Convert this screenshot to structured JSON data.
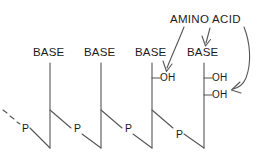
{
  "figure": {
    "title_text": "AMINO ACID",
    "stroke_color": "#555555",
    "text_color": "#1b1b1b",
    "background_color": "#ffffff",
    "width": 261,
    "height": 162
  },
  "annotation": {
    "amino_acid_label": "AMINO ACID",
    "arrow_count": 3,
    "arrows": [
      {
        "name": "arrow-to-first-oh",
        "target": "OH on third base unit"
      },
      {
        "name": "arrow-to-fourth-base",
        "target": "fourth base unit"
      },
      {
        "name": "arrow-to-second-oh",
        "target": "lower OH on fourth base unit"
      }
    ]
  },
  "units": [
    {
      "index": 1,
      "base_label": "BASE",
      "phosphate_label": "P",
      "oh_labels": [],
      "has_leading_dashes": true
    },
    {
      "index": 2,
      "base_label": "BASE",
      "phosphate_label": "P",
      "oh_labels": [],
      "has_leading_dashes": false
    },
    {
      "index": 3,
      "base_label": "BASE",
      "phosphate_label": "P",
      "oh_labels": [
        "OH"
      ],
      "has_leading_dashes": false
    },
    {
      "index": 4,
      "base_label": "BASE",
      "phosphate_label": "P",
      "oh_labels": [
        "OH",
        "OH"
      ],
      "has_leading_dashes": false
    }
  ],
  "labels": {
    "base_1": "BASE",
    "base_2": "BASE",
    "base_3": "BASE",
    "base_4": "BASE",
    "p_1": "P",
    "p_2": "P",
    "p_3": "P",
    "p_4": "P",
    "oh_3a": "OH",
    "oh_4a": "OH",
    "oh_4b": "OH"
  }
}
